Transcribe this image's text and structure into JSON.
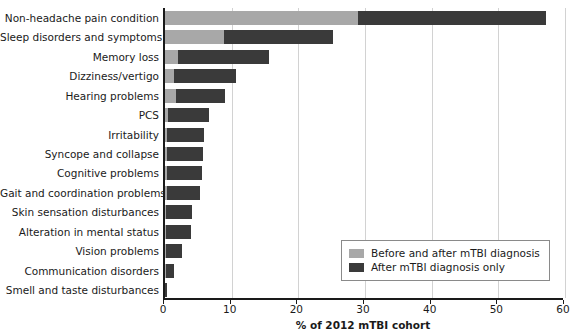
{
  "chart_data": {
    "type": "bar",
    "orientation": "horizontal",
    "stacked": true,
    "title": "",
    "xlabel": "% of 2012 mTBI cohort",
    "ylabel": "",
    "xlim": [
      0,
      60
    ],
    "xticks": [
      0,
      10,
      20,
      30,
      40,
      50,
      60
    ],
    "xtick_labels": [
      "0",
      "10",
      "20",
      "30",
      "40",
      "50",
      "60"
    ],
    "grid": "vertical",
    "legend_position": "lower right",
    "colors": {
      "before_and_after": "#a8a8a8",
      "after_only": "#3a3a3a",
      "axis": "#1a1a1a",
      "gridline": "#d2d2d2"
    },
    "categories": [
      "Non-headache pain condition",
      "Sleep disorders and symptoms",
      "Memory loss",
      "Dizziness/vertigo",
      "Hearing problems",
      "PCS",
      "Irritability",
      "Syncope and collapse",
      "Cognitive problems",
      "Gait and coordination problems",
      "Skin sensation disturbances",
      "Alteration in mental status",
      "Vision problems",
      "Communication disorders",
      "Smell and taste disturbances"
    ],
    "series": [
      {
        "name": "Before and after mTBI diagnosis",
        "values": [
          28.9,
          8.8,
          2.0,
          1.4,
          1.6,
          0.4,
          0.3,
          0.3,
          0.3,
          0.3,
          0.2,
          0.2,
          0.2,
          0.1,
          0.05
        ]
      },
      {
        "name": "After mTBI diagnosis only",
        "values": [
          28.2,
          16.4,
          13.6,
          9.2,
          7.4,
          6.2,
          5.6,
          5.4,
          5.2,
          5.0,
          3.8,
          3.7,
          2.3,
          1.2,
          0.25
        ]
      }
    ],
    "totals": [
      57.1,
      25.2,
      15.6,
      10.6,
      9.0,
      6.6,
      5.9,
      5.7,
      5.5,
      5.3,
      4.0,
      3.9,
      2.5,
      1.3,
      0.3
    ]
  },
  "legend": {
    "entries": [
      {
        "label": "Before and after mTBI diagnosis",
        "color": "#a8a8a8"
      },
      {
        "label": "After mTBI diagnosis only",
        "color": "#3a3a3a"
      }
    ]
  }
}
